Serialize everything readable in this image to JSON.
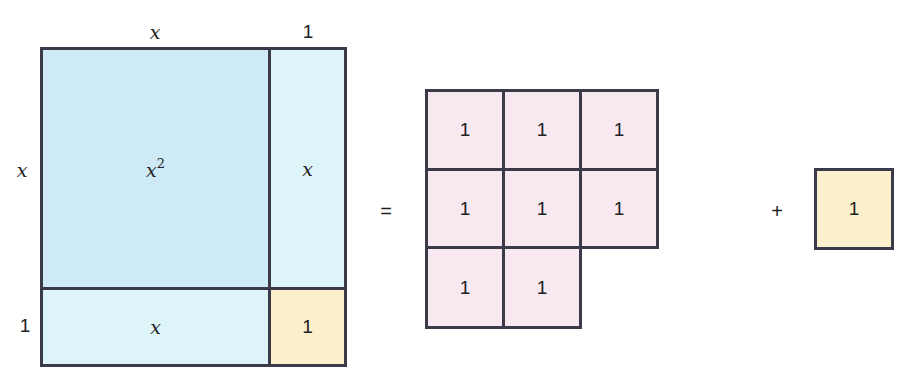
{
  "left_figure": {
    "top_labels": [
      "x",
      "1"
    ],
    "side_labels": [
      "x",
      "1"
    ],
    "regions": {
      "x_squared": {
        "base": "x",
        "exp": "2"
      },
      "right_strip": "x",
      "bottom_strip": "x",
      "corner": "1"
    }
  },
  "equals_sign": "=",
  "unit_grid": {
    "rows": [
      [
        "1",
        "1",
        "1"
      ],
      [
        "1",
        "1",
        "1"
      ],
      [
        "1",
        "1"
      ]
    ]
  },
  "plus_sign": "+",
  "extra_tile": "1",
  "colors": {
    "x_squared": "#cfeaf7",
    "x_tile": "#ddf4f9",
    "unit_tile_yellow": "#fcf0cc",
    "unit_tile_pink": "#f8e8f0",
    "border": "#3a3a48"
  }
}
